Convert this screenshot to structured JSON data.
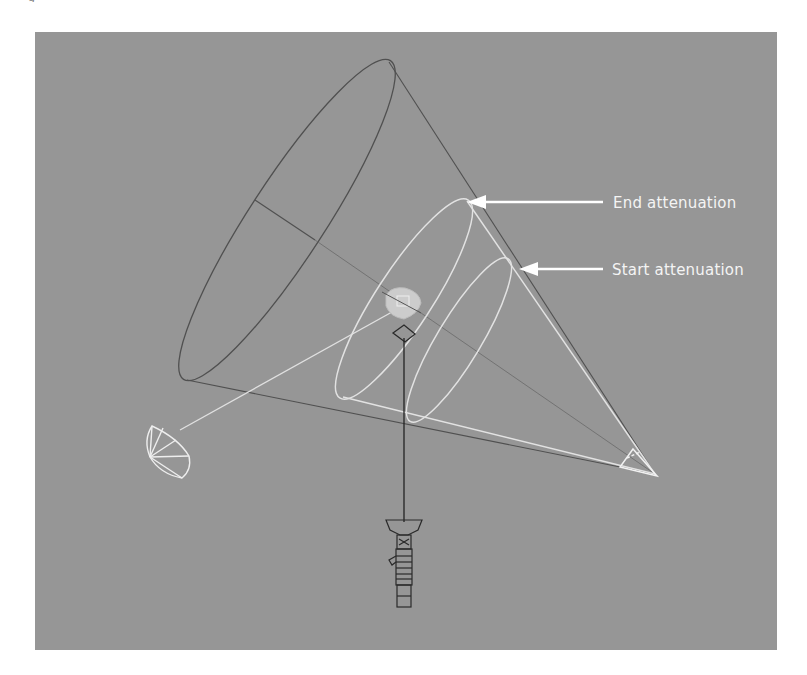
{
  "figure": {
    "caption_fragment": "g"
  },
  "viewport": {
    "background": "#969696",
    "description": "3D viewport wireframe of a spotlight cone showing attenuation ranges"
  },
  "annotations": [
    {
      "id": "end",
      "label": "End attenuation",
      "arrow_tip": [
        467,
        202
      ],
      "label_pos": [
        613,
        194
      ]
    },
    {
      "id": "start",
      "label": "Start attenuation",
      "arrow_tip": [
        520,
        268
      ],
      "label_pos": [
        612,
        261
      ]
    }
  ],
  "colors": {
    "outer_cone": "#555555",
    "attenuation": "#e6e6e6",
    "arrow": "#ffffff",
    "fixture": "#2a2a2a",
    "highlight": "#cfcfcf"
  },
  "objects": {
    "spotlight_apex": "spot-cone-apex",
    "target": "target-dome",
    "fixture": "spotlight-fixture",
    "pivot": "pivot-gizmo"
  }
}
